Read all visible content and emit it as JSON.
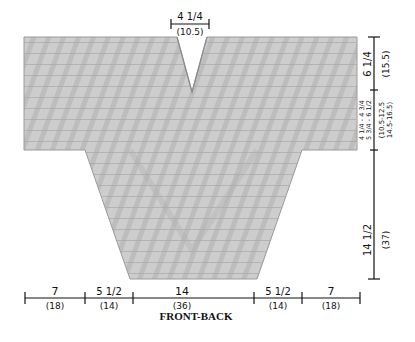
{
  "diagram": {
    "caption": "FRONT-BACK",
    "colors": {
      "garment_fill": "#cfcfcf",
      "garment_edge": "#9a9a9a",
      "stripe": "#b3b3b3",
      "ink": "#111111",
      "background": "#ffffff"
    },
    "neck": {
      "width_in": "4 1/4",
      "width_cm": "(10.5)"
    },
    "bottom_dimensions": [
      {
        "in": "7",
        "cm": "(18)"
      },
      {
        "in": "5 1/2",
        "cm": "(14)"
      },
      {
        "in": "14",
        "cm": "(36)"
      },
      {
        "in": "5 1/2",
        "cm": "(14)"
      },
      {
        "in": "7",
        "cm": "(18)"
      }
    ],
    "side_dimensions": {
      "upper": {
        "in": "6 1/4",
        "cm": "(15.5)"
      },
      "middle": {
        "in_line1": "4 1/4 - 4 3/4",
        "in_line2": "5 3/4 - 6 1/2",
        "cm_line1": "(10.5-12.5",
        "cm_line2": "14.5-16.5)"
      },
      "lower": {
        "in": "14 1/2",
        "cm": "(37)"
      }
    }
  }
}
